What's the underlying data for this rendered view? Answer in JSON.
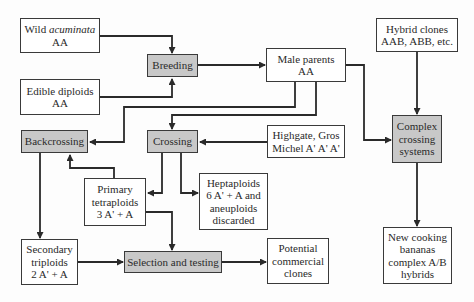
{
  "diagram": {
    "colors": {
      "process_fill": "#c8c8c8",
      "node_fill": "#ffffff",
      "line": "#2a2a2a"
    },
    "nodes": {
      "wild_acuminata": {
        "line1_plain": "Wild ",
        "line1_italic": "acuminata",
        "line2": "AA"
      },
      "edible_diploids": {
        "line1": "Edible diploids",
        "line2": "AA"
      },
      "breeding": {
        "label": "Breeding"
      },
      "male_parents": {
        "line1": "Male parents",
        "line2": "AA"
      },
      "hybrid_clones": {
        "line1": "Hybrid clones",
        "line2": "AAB, ABB, etc."
      },
      "backcrossing": {
        "label": "Backcrossing"
      },
      "crossing": {
        "label": "Crossing"
      },
      "highgate": {
        "line1": "Highgate, Gros",
        "line2": "Michel A' A' A'"
      },
      "complex_crossing": {
        "line1": "Complex",
        "line2": "crossing",
        "line3": "systems"
      },
      "primary_tetraploids": {
        "line1": "Primary",
        "line2": "tetraploids",
        "line3": "3 A' + A"
      },
      "heptaploids": {
        "line1": "Heptaploids",
        "line2": "6 A' + A and",
        "line3": "aneuploids",
        "line4": "discarded"
      },
      "secondary_triploids": {
        "line1": "Secondary",
        "line2": "triploids",
        "line3": "2 A' + A"
      },
      "selection_testing": {
        "label": "Selection and testing"
      },
      "potential_clones": {
        "line1": "Potential",
        "line2": "commercial",
        "line3": "clones"
      },
      "new_cooking": {
        "line1": "New cooking",
        "line2": "bananas",
        "line3": "complex A/B",
        "line4": "hybrids"
      }
    },
    "edges": [
      [
        "wild_acuminata",
        "breeding"
      ],
      [
        "edible_diploids",
        "breeding"
      ],
      [
        "breeding",
        "male_parents"
      ],
      [
        "male_parents",
        "backcrossing"
      ],
      [
        "male_parents",
        "crossing"
      ],
      [
        "male_parents",
        "complex_crossing"
      ],
      [
        "hybrid_clones",
        "complex_crossing"
      ],
      [
        "highgate",
        "crossing"
      ],
      [
        "crossing",
        "primary_tetraploids"
      ],
      [
        "crossing",
        "heptaploids"
      ],
      [
        "primary_tetraploids",
        "backcrossing"
      ],
      [
        "primary_tetraploids",
        "selection_testing"
      ],
      [
        "backcrossing",
        "secondary_triploids"
      ],
      [
        "secondary_triploids",
        "selection_testing"
      ],
      [
        "selection_testing",
        "potential_clones"
      ],
      [
        "complex_crossing",
        "new_cooking"
      ]
    ]
  }
}
